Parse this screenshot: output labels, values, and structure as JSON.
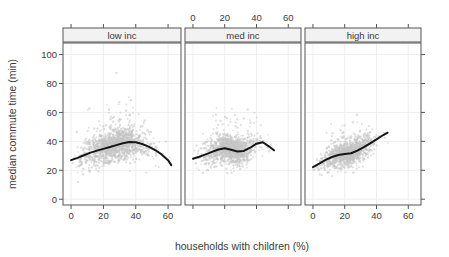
{
  "chart_data": {
    "type": "scatter",
    "title": "",
    "xlabel": "households with children (%)",
    "ylabel": "median commute time (min)",
    "xlim": [
      -5,
      68
    ],
    "ylim": [
      -4,
      108
    ],
    "xticks": [
      0,
      20,
      40,
      60
    ],
    "yticks": [
      0,
      20,
      40,
      60,
      80,
      100
    ],
    "xtick_labels": [
      "0",
      "20",
      "40",
      "60"
    ],
    "ytick_labels": [
      "0",
      "20",
      "40",
      "60",
      "80",
      "100"
    ],
    "grid": true,
    "legend": "none",
    "layout": "3 horizontal facet panels sharing the y axis",
    "axis_sides": {
      "left": "y tick labels",
      "bottom": "x tick labels on panel 1 and panel 3",
      "top": "x tick labels on panel 2 only",
      "right": "y ticks unlabeled"
    },
    "point_color": "#c4c4c4",
    "point_size": 1.6,
    "line_color": "#161616",
    "line_width": 2.0,
    "panels": [
      {
        "label": "low inc",
        "x_label_position": "bottom",
        "series": [
          {
            "name": "smoothed trend",
            "type": "line",
            "x": [
              0,
              4,
              8,
              12,
              16,
              20,
              24,
              28,
              32,
              36,
              40,
              44,
              48,
              52,
              56,
              60,
              62
            ],
            "values": [
              27.0,
              28.6,
              30.4,
              32.2,
              33.6,
              34.8,
              36.1,
              37.4,
              38.7,
              39.6,
              39.4,
              38.2,
              36.4,
              34.0,
              31.0,
              27.0,
              23.6
            ]
          },
          {
            "name": "counties",
            "type": "scatter",
            "cloud": {
              "x_center": 27,
              "y_center": 34,
              "x_spread": 10,
              "y_spread": 9,
              "n": 1400,
              "x_range": [
                0,
                62
              ],
              "y_range": [
                2,
                101
              ]
            }
          }
        ]
      },
      {
        "label": "med inc",
        "x_label_position": "top",
        "series": [
          {
            "name": "smoothed trend",
            "type": "line",
            "x": [
              0,
              4,
              8,
              12,
              16,
              20,
              24,
              28,
              32,
              36,
              40,
              44,
              48,
              51
            ],
            "values": [
              28.0,
              29.4,
              31.0,
              32.7,
              34.4,
              35.3,
              34.2,
              33.0,
              33.4,
              35.6,
              38.4,
              39.4,
              36.4,
              33.8
            ]
          },
          {
            "name": "counties",
            "type": "scatter",
            "cloud": {
              "x_center": 24,
              "y_center": 33,
              "x_spread": 8.5,
              "y_spread": 8,
              "n": 1200,
              "x_range": [
                0,
                52
              ],
              "y_range": [
                4,
                64
              ]
            }
          }
        ]
      },
      {
        "label": "high inc",
        "x_label_position": "bottom",
        "series": [
          {
            "name": "smoothed trend",
            "type": "line",
            "x": [
              0,
              4,
              8,
              12,
              16,
              20,
              24,
              28,
              32,
              36,
              40,
              44,
              47
            ],
            "values": [
              22.2,
              24.6,
              27.2,
              29.2,
              30.6,
              31.2,
              31.8,
              33.6,
              36.0,
              38.6,
              41.4,
              44.2,
              46.0
            ]
          },
          {
            "name": "counties",
            "type": "scatter",
            "cloud": {
              "x_center": 22,
              "y_center": 31,
              "x_spread": 8,
              "y_spread": 7,
              "n": 1150,
              "x_range": [
                0,
                48
              ],
              "y_range": [
                6,
                60
              ]
            }
          }
        ]
      }
    ]
  }
}
